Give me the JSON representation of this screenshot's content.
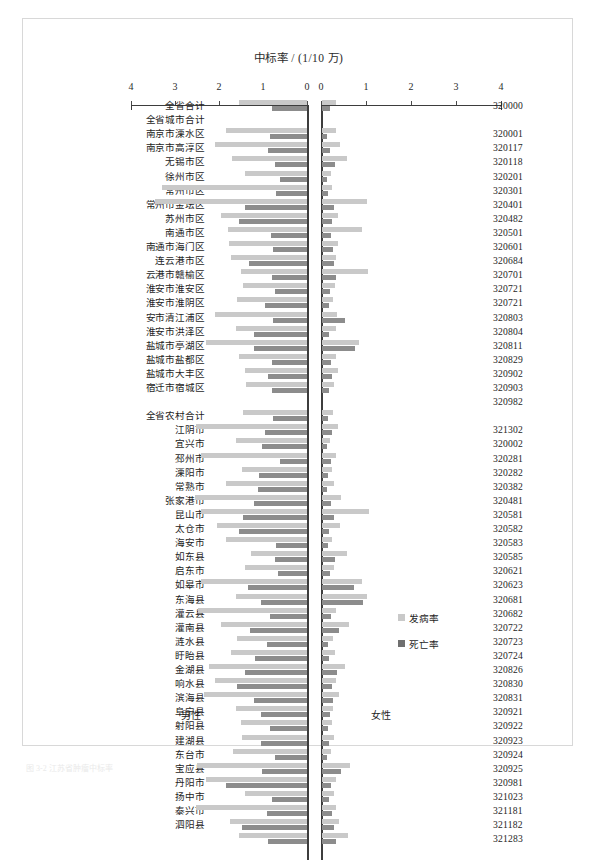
{
  "figure": {
    "title": "中标率 / (1/10 万)",
    "male_label": "男性",
    "female_label": "女性",
    "caption": "图 3-2  江苏省肿瘤中标率"
  },
  "legend": {
    "position": "inside-right",
    "items": [
      {
        "key": "incidence",
        "label": "发病率",
        "color": "#c9c9c9"
      },
      {
        "key": "mortality",
        "label": "死亡率",
        "color": "#6f6f6f"
      }
    ]
  },
  "axes": {
    "ticks": [
      0,
      1,
      2,
      3,
      4
    ],
    "left_ticklabels": [
      "4",
      "3",
      "2",
      "1",
      "0"
    ],
    "right_ticklabels": [
      "0",
      "1",
      "2",
      "3",
      "4"
    ],
    "min": 0,
    "max": 4,
    "unit": "1/10万"
  },
  "chart_data": {
    "type": "bar",
    "title": "中标率 / (1/10 万)",
    "xlabel": "中标率 / (1/10 万)",
    "ylabel": "",
    "xlim": [
      0,
      4
    ],
    "grid": false,
    "orientation": "horizontal-butterfly",
    "panels": [
      "男性",
      "女性"
    ],
    "series": [
      {
        "name": "发病率",
        "color": "#c9c9c9"
      },
      {
        "name": "死亡率",
        "color": "#8c8c8c"
      }
    ],
    "rows": [
      {
        "label": "全省合计",
        "code": "320000",
        "group": "total",
        "male_incidence": 1.55,
        "male_mortality": 0.8,
        "female_incidence": 0.3,
        "female_mortality": 0.18
      },
      {
        "label": "全省城市合计",
        "code": "",
        "group": "city-header",
        "male_incidence": 0,
        "male_mortality": 0,
        "female_incidence": 0,
        "female_mortality": 0
      },
      {
        "label": "南京市溧水区",
        "code": "320001",
        "group": "city",
        "male_incidence": 1.85,
        "male_mortality": 0.85,
        "female_incidence": 0.32,
        "female_mortality": 0.12
      },
      {
        "label": "南京市高淳区",
        "code": "320117",
        "group": "city",
        "male_incidence": 2.1,
        "male_mortality": 0.88,
        "female_incidence": 0.4,
        "female_mortality": 0.18
      },
      {
        "label": "无锡市区",
        "code": "320118",
        "group": "city",
        "male_incidence": 1.7,
        "male_mortality": 0.72,
        "female_incidence": 0.55,
        "female_mortality": 0.28
      },
      {
        "label": "徐州市区",
        "code": "320201",
        "group": "city",
        "male_incidence": 1.42,
        "male_mortality": 0.62,
        "female_incidence": 0.2,
        "female_mortality": 0.12
      },
      {
        "label": "常州市区",
        "code": "320301",
        "group": "city",
        "male_incidence": 3.3,
        "male_mortality": 0.7,
        "female_incidence": 0.22,
        "female_mortality": 0.14
      },
      {
        "label": "常州市金坛区",
        "code": "320401",
        "group": "city",
        "male_incidence": 3.45,
        "male_mortality": 1.4,
        "female_incidence": 1.0,
        "female_mortality": 0.26
      },
      {
        "label": "苏州市区",
        "code": "320482",
        "group": "city",
        "male_incidence": 1.95,
        "male_mortality": 1.55,
        "female_incidence": 0.35,
        "female_mortality": 0.22
      },
      {
        "label": "南通市区",
        "code": "320501",
        "group": "city",
        "male_incidence": 1.8,
        "male_mortality": 0.82,
        "female_incidence": 0.88,
        "female_mortality": 0.2
      },
      {
        "label": "南通市海门区",
        "code": "320601",
        "group": "city",
        "male_incidence": 1.78,
        "male_mortality": 0.78,
        "female_incidence": 0.36,
        "female_mortality": 0.24
      },
      {
        "label": "连云港市区",
        "code": "320684",
        "group": "city",
        "male_incidence": 1.72,
        "male_mortality": 1.32,
        "female_incidence": 0.3,
        "female_mortality": 0.26
      },
      {
        "label": "云港市赣榆区",
        "code": "320701",
        "group": "city",
        "male_incidence": 1.5,
        "male_mortality": 0.8,
        "female_incidence": 1.02,
        "female_mortality": 0.3
      },
      {
        "label": "淮安市淮安区",
        "code": "320721",
        "group": "city",
        "male_incidence": 1.45,
        "male_mortality": 0.72,
        "female_incidence": 0.28,
        "female_mortality": 0.18
      },
      {
        "label": "淮安市淮阴区",
        "code": "320721",
        "group": "city",
        "male_incidence": 1.58,
        "male_mortality": 0.95,
        "female_incidence": 0.24,
        "female_mortality": 0.16
      },
      {
        "label": "安市清江浦区",
        "code": "320803",
        "group": "city",
        "male_incidence": 2.1,
        "male_mortality": 0.78,
        "female_incidence": 0.34,
        "female_mortality": 0.5
      },
      {
        "label": "淮安市洪泽区",
        "code": "320804",
        "group": "city",
        "male_incidence": 1.62,
        "male_mortality": 1.2,
        "female_incidence": 0.3,
        "female_mortality": 0.16
      },
      {
        "label": "盐城市亭湖区",
        "code": "320811",
        "group": "city",
        "male_incidence": 2.3,
        "male_mortality": 1.2,
        "female_incidence": 0.82,
        "female_mortality": 0.74
      },
      {
        "label": "盐城市盐都区",
        "code": "320829",
        "group": "city",
        "male_incidence": 1.55,
        "male_mortality": 0.8,
        "female_incidence": 0.32,
        "female_mortality": 0.2
      },
      {
        "label": "盐城市大丰区",
        "code": "320902",
        "group": "city",
        "male_incidence": 1.42,
        "male_mortality": 0.88,
        "female_incidence": 0.36,
        "female_mortality": 0.22
      },
      {
        "label": "宿迁市宿城区",
        "code": "320903",
        "group": "city",
        "male_incidence": 1.38,
        "male_mortality": 0.8,
        "female_incidence": 0.26,
        "female_mortality": 0.16
      },
      {
        "label": "",
        "code": "320982",
        "group": "city",
        "male_incidence": 0,
        "male_mortality": 0,
        "female_incidence": 0,
        "female_mortality": 0
      },
      {
        "label": "全省农村合计",
        "code": "",
        "group": "rural-header",
        "male_incidence": 1.45,
        "male_mortality": 0.78,
        "female_incidence": 0.24,
        "female_mortality": 0.14
      },
      {
        "label": "江阴市",
        "code": "321302",
        "group": "rural",
        "male_incidence": 2.52,
        "male_mortality": 0.95,
        "female_incidence": 0.36,
        "female_mortality": 0.22
      },
      {
        "label": "宜兴市",
        "code": "320002",
        "group": "rural",
        "male_incidence": 1.62,
        "male_mortality": 1.02,
        "female_incidence": 0.18,
        "female_mortality": 0.12
      },
      {
        "label": "邳州市",
        "code": "320281",
        "group": "rural",
        "male_incidence": 2.4,
        "male_mortality": 0.62,
        "female_incidence": 0.3,
        "female_mortality": 0.2
      },
      {
        "label": "溧阳市",
        "code": "320282",
        "group": "rural",
        "male_incidence": 1.48,
        "male_mortality": 1.1,
        "female_incidence": 0.22,
        "female_mortality": 0.14
      },
      {
        "label": "常熟市",
        "code": "320382",
        "group": "rural",
        "male_incidence": 1.85,
        "male_mortality": 1.12,
        "female_incidence": 0.26,
        "female_mortality": 0.12
      },
      {
        "label": "张家港市",
        "code": "320481",
        "group": "rural",
        "male_incidence": 2.55,
        "male_mortality": 1.2,
        "female_incidence": 0.42,
        "female_mortality": 0.2
      },
      {
        "label": "昆山市",
        "code": "320581",
        "group": "rural",
        "male_incidence": 2.42,
        "male_mortality": 1.45,
        "female_incidence": 1.05,
        "female_mortality": 0.26
      },
      {
        "label": "太仓市",
        "code": "320582",
        "group": "rural",
        "male_incidence": 2.05,
        "male_mortality": 1.55,
        "female_incidence": 0.4,
        "female_mortality": 0.16
      },
      {
        "label": "海安市",
        "code": "320583",
        "group": "rural",
        "male_incidence": 1.85,
        "male_mortality": 0.7,
        "female_incidence": 0.22,
        "female_mortality": 0.14
      },
      {
        "label": "如东县",
        "code": "320585",
        "group": "rural",
        "male_incidence": 1.28,
        "male_mortality": 0.72,
        "female_incidence": 0.55,
        "female_mortality": 0.28
      },
      {
        "label": "启东市",
        "code": "320621",
        "group": "rural",
        "male_incidence": 1.4,
        "male_mortality": 0.66,
        "female_incidence": 0.26,
        "female_mortality": 0.18
      },
      {
        "label": "如皋市",
        "code": "320623",
        "group": "rural",
        "male_incidence": 2.4,
        "male_mortality": 1.35,
        "female_incidence": 0.88,
        "female_mortality": 0.7
      },
      {
        "label": "东海县",
        "code": "320681",
        "group": "rural",
        "male_incidence": 1.62,
        "male_mortality": 1.05,
        "female_incidence": 1.0,
        "female_mortality": 0.92
      },
      {
        "label": "灌云县",
        "code": "320682",
        "group": "rural",
        "male_incidence": 2.48,
        "male_mortality": 0.85,
        "female_incidence": 0.3,
        "female_mortality": 0.2
      },
      {
        "label": "灌南县",
        "code": "320722",
        "group": "rural",
        "male_incidence": 1.95,
        "male_mortality": 1.3,
        "female_incidence": 0.6,
        "female_mortality": 0.38
      },
      {
        "label": "涟水县",
        "code": "320723",
        "group": "rural",
        "male_incidence": 1.58,
        "male_mortality": 0.92,
        "female_incidence": 0.24,
        "female_mortality": 0.14
      },
      {
        "label": "盱眙县",
        "code": "320724",
        "group": "rural",
        "male_incidence": 1.72,
        "male_mortality": 1.18,
        "female_incidence": 0.28,
        "female_mortality": 0.16
      },
      {
        "label": "金湖县",
        "code": "320826",
        "group": "rural",
        "male_incidence": 2.22,
        "male_mortality": 1.42,
        "female_incidence": 0.52,
        "female_mortality": 0.34
      },
      {
        "label": "响水县",
        "code": "320830",
        "group": "rural",
        "male_incidence": 2.1,
        "male_mortality": 1.6,
        "female_incidence": 0.3,
        "female_mortality": 0.22
      },
      {
        "label": "滨海县",
        "code": "320831",
        "group": "rural",
        "male_incidence": 2.35,
        "male_mortality": 1.2,
        "female_incidence": 0.38,
        "female_mortality": 0.24
      },
      {
        "label": "阜宁县",
        "code": "320921",
        "group": "rural",
        "male_incidence": 1.62,
        "male_mortality": 1.05,
        "female_incidence": 0.24,
        "female_mortality": 0.18
      },
      {
        "label": "射阳县",
        "code": "320922",
        "group": "rural",
        "male_incidence": 1.5,
        "male_mortality": 0.85,
        "female_incidence": 0.22,
        "female_mortality": 0.14
      },
      {
        "label": "建湖县",
        "code": "320923",
        "group": "rural",
        "male_incidence": 1.48,
        "male_mortality": 1.05,
        "female_incidence": 0.26,
        "female_mortality": 0.16
      },
      {
        "label": "东台市",
        "code": "320924",
        "group": "rural",
        "male_incidence": 1.68,
        "male_mortality": 0.72,
        "female_incidence": 0.2,
        "female_mortality": 0.12
      },
      {
        "label": "宝应县",
        "code": "320925",
        "group": "rural",
        "male_incidence": 2.5,
        "male_mortality": 1.02,
        "female_incidence": 0.62,
        "female_mortality": 0.42
      },
      {
        "label": "丹阳市",
        "code": "320981",
        "group": "rural",
        "male_incidence": 2.3,
        "male_mortality": 1.85,
        "female_incidence": 0.3,
        "female_mortality": 0.2
      },
      {
        "label": "扬中市",
        "code": "321023",
        "group": "rural",
        "male_incidence": 1.42,
        "male_mortality": 0.8,
        "female_incidence": 0.26,
        "female_mortality": 0.16
      },
      {
        "label": "泰兴市",
        "code": "321181",
        "group": "rural",
        "male_incidence": 2.52,
        "male_mortality": 0.9,
        "female_incidence": 0.32,
        "female_mortality": 0.22
      },
      {
        "label": "泗阳县",
        "code": "321182",
        "group": "rural",
        "male_incidence": 1.75,
        "male_mortality": 1.48,
        "female_incidence": 0.38,
        "female_mortality": 0.26
      },
      {
        "label": "",
        "code": "321283",
        "group": "rural",
        "male_incidence": 1.55,
        "male_mortality": 0.88,
        "female_incidence": 0.58,
        "female_mortality": 0.3
      }
    ]
  }
}
